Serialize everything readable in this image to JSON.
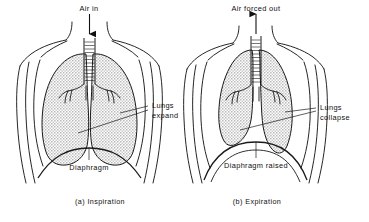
{
  "figure": {
    "background_color": "#ffffff",
    "line_color": "#1a1a1a",
    "lung_fill_color": "#cfcfcf",
    "text_color": "#101010"
  },
  "panels": [
    {
      "id": "panel-a",
      "caption": "(a) Inspiration",
      "air_label": "Air in",
      "arrow_direction": "down",
      "lung_label_line1": "Lungs",
      "lung_label_line2": "expand",
      "diaphragm_label": "Diaphragm",
      "icons": {
        "airflow_arrow": "arrow-down-icon",
        "trachea": "trachea-icon",
        "bronchi": "bronchi-icon",
        "lung": "lung-icon",
        "diaphragm": "diaphragm-icon",
        "torso": "torso-outline-icon"
      }
    },
    {
      "id": "panel-b",
      "caption": "(b) Expiration",
      "air_label": "Air forced out",
      "arrow_direction": "up",
      "lung_label_line1": "Lungs",
      "lung_label_line2": "collapse",
      "diaphragm_label": "Diaphragm raised",
      "icons": {
        "airflow_arrow": "arrow-up-icon",
        "trachea": "trachea-icon",
        "bronchi": "bronchi-icon",
        "lung": "lung-icon",
        "diaphragm": "diaphragm-icon",
        "torso": "torso-outline-icon"
      }
    }
  ]
}
